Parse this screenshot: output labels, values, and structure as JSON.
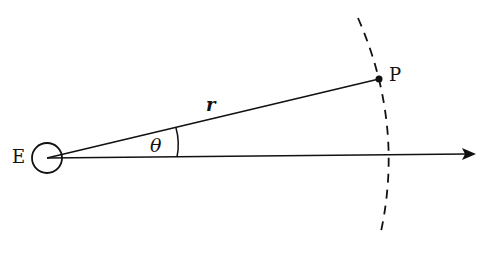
{
  "diagram": {
    "labels": {
      "earth": "E",
      "point": "P",
      "radius": "r",
      "angle": "θ"
    },
    "elements": [
      {
        "id": "earth-circle",
        "type": "circle",
        "label": "E"
      },
      {
        "id": "radius-line",
        "type": "line",
        "from": "E",
        "to": "P",
        "label": "r"
      },
      {
        "id": "reference-axis",
        "type": "arrow",
        "from": "E",
        "direction": "right"
      },
      {
        "id": "angle-arc",
        "type": "arc",
        "between": [
          "radius-line",
          "reference-axis"
        ],
        "label": "θ"
      },
      {
        "id": "orbit-arc",
        "type": "dashed-arc",
        "passes_through": "P"
      },
      {
        "id": "point-p",
        "type": "dot",
        "label": "P"
      }
    ],
    "colors": {
      "stroke": "#111111",
      "background": "#ffffff"
    }
  }
}
